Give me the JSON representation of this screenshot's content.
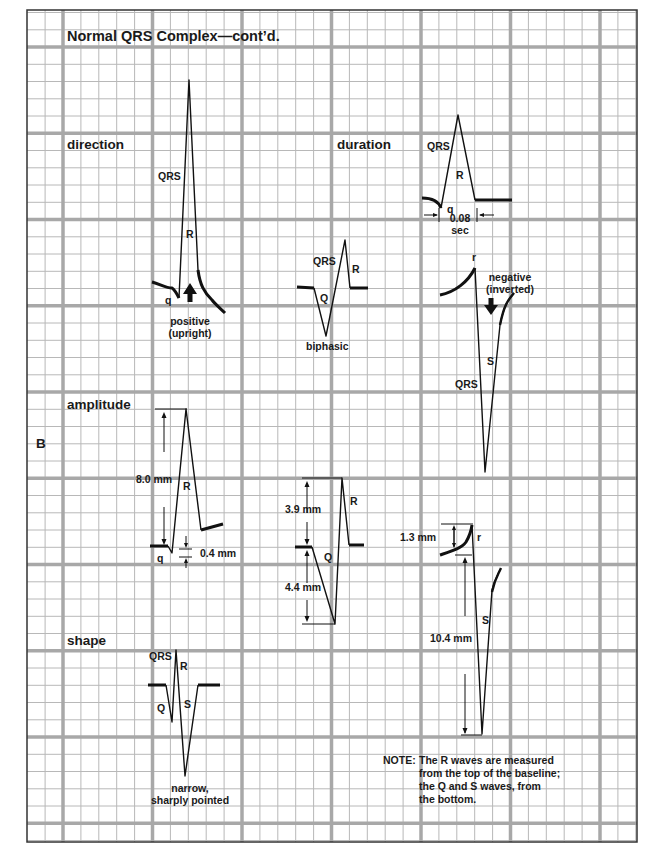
{
  "figure": {
    "panel_letter": "B",
    "title": "Normal QRS Complex—cont’d.",
    "grid_colors": {
      "minor_line": "#b3b3b3",
      "major_line": "#a6a6a6",
      "border": "#333333",
      "trace": "#111111"
    }
  },
  "sections": {
    "direction": {
      "heading": "direction",
      "positive": {
        "qrs_label": "QRS",
        "r_label": "R",
        "q_label": "q",
        "caption_line1": "positive",
        "caption_line2": "(upright)",
        "arrow": "up-arrow-icon"
      },
      "biphasic": {
        "qrs_label": "QRS",
        "r_label": "R",
        "q_label": "Q",
        "caption": "biphasic"
      },
      "negative": {
        "r_label": "r",
        "s_label": "S",
        "qrs_label": "QRS",
        "caption_line1": "negative",
        "caption_line2": "(inverted)",
        "arrow": "down-arrow-icon"
      }
    },
    "duration": {
      "heading": "duration",
      "qrs_label": "QRS",
      "r_label": "R",
      "q_label": "q",
      "measure_value": "0.08",
      "measure_unit": "sec"
    },
    "amplitude": {
      "heading": "amplitude",
      "example1": {
        "r_label": "R",
        "q_label": "q",
        "r_measure": "8.0 mm",
        "q_measure": "0.4 mm"
      },
      "example2": {
        "r_label": "R",
        "q_label": "Q",
        "r_measure": "3.9 mm",
        "q_measure": "4.4 mm"
      },
      "example3": {
        "r_label": "r",
        "s_label": "S",
        "r_measure": "1.3 mm",
        "s_measure": "10.4 mm"
      }
    },
    "shape": {
      "heading": "shape",
      "qrs_label": "QRS",
      "r_label": "R",
      "q_label": "Q",
      "s_label": "S",
      "caption_line1": "narrow,",
      "caption_line2": "sharply pointed"
    }
  },
  "note": {
    "prefix": "NOTE:",
    "line1": "The R waves are measured",
    "line2": "from the top of the baseline;",
    "line3": "the Q and S waves, from",
    "line4": "the bottom."
  }
}
